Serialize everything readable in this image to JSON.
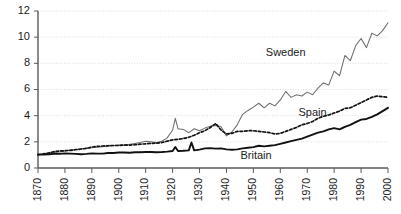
{
  "chart_data": {
    "type": "line",
    "title": "",
    "subtitle": "",
    "xlabel": "",
    "ylabel": "",
    "xlim": [
      1870,
      2000
    ],
    "ylim": [
      0,
      12
    ],
    "grid": true,
    "legend_position": "inline-annotations",
    "y_ticks": [
      0,
      2,
      4,
      6,
      8,
      10,
      12
    ],
    "y_tick_labels": [
      "0",
      "2",
      "4",
      "6",
      "8",
      "10",
      "12"
    ],
    "x_ticks": [
      1870,
      1880,
      1890,
      1900,
      1910,
      1920,
      1930,
      1940,
      1950,
      1960,
      1970,
      1980,
      1990,
      2000
    ],
    "x_tick_labels": [
      "1870",
      "1880",
      "1890",
      "1900",
      "1910",
      "1920",
      "1930",
      "1940",
      "1950",
      "1960",
      "1970",
      "1980",
      "1990",
      "2000"
    ],
    "annotations": [
      {
        "text": "Sweden",
        "x": 1962,
        "y": 8.55
      },
      {
        "text": "Spain",
        "x": 1972,
        "y": 4.0
      },
      {
        "text": "Britain",
        "x": 1951,
        "y": 0.65
      }
    ],
    "series": [
      {
        "name": "Sweden",
        "style": "thin-solid-gray",
        "color": "#6e6e6e",
        "x": [
          1870,
          1872,
          1874,
          1876,
          1878,
          1880,
          1882,
          1884,
          1886,
          1888,
          1890,
          1892,
          1894,
          1896,
          1898,
          1900,
          1902,
          1904,
          1906,
          1908,
          1910,
          1912,
          1914,
          1916,
          1918,
          1920,
          1921,
          1922,
          1924,
          1926,
          1928,
          1930,
          1932,
          1934,
          1936,
          1938,
          1940,
          1942,
          1944,
          1946,
          1948,
          1950,
          1952,
          1954,
          1956,
          1958,
          1960,
          1962,
          1964,
          1966,
          1968,
          1970,
          1972,
          1974,
          1976,
          1978,
          1980,
          1982,
          1984,
          1986,
          1988,
          1990,
          1992,
          1994,
          1996,
          1998,
          2000
        ],
        "values": [
          1.02,
          1.06,
          1.12,
          1.18,
          1.22,
          1.3,
          1.38,
          1.42,
          1.45,
          1.5,
          1.55,
          1.58,
          1.62,
          1.68,
          1.72,
          1.75,
          1.78,
          1.82,
          1.88,
          1.95,
          2.05,
          2.0,
          1.95,
          2.05,
          2.3,
          2.9,
          3.8,
          3.0,
          2.95,
          2.7,
          3.0,
          2.85,
          3.05,
          3.2,
          3.25,
          3.15,
          2.45,
          2.75,
          3.3,
          4.1,
          4.4,
          4.65,
          4.95,
          4.6,
          4.95,
          4.75,
          5.2,
          5.85,
          5.4,
          5.6,
          5.5,
          5.8,
          5.6,
          6.1,
          6.5,
          6.35,
          7.4,
          7.05,
          8.6,
          8.2,
          9.35,
          9.9,
          9.2,
          10.3,
          10.1,
          10.5,
          11.1
        ]
      },
      {
        "name": "Spain",
        "style": "dashed-black",
        "color": "#111111",
        "x": [
          1870,
          1872,
          1874,
          1876,
          1878,
          1880,
          1882,
          1884,
          1886,
          1888,
          1890,
          1892,
          1894,
          1896,
          1898,
          1900,
          1902,
          1904,
          1906,
          1908,
          1910,
          1912,
          1914,
          1916,
          1918,
          1920,
          1922,
          1924,
          1926,
          1928,
          1930,
          1932,
          1934,
          1936,
          1938,
          1940,
          1942,
          1944,
          1946,
          1948,
          1950,
          1952,
          1954,
          1956,
          1958,
          1960,
          1962,
          1964,
          1966,
          1968,
          1970,
          1972,
          1974,
          1976,
          1978,
          1980,
          1982,
          1984,
          1986,
          1988,
          1990,
          1992,
          1994,
          1996,
          1998,
          2000
        ],
        "values": [
          1.02,
          1.08,
          1.15,
          1.25,
          1.3,
          1.32,
          1.35,
          1.4,
          1.45,
          1.5,
          1.6,
          1.65,
          1.68,
          1.7,
          1.72,
          1.72,
          1.75,
          1.75,
          1.78,
          1.82,
          1.85,
          1.88,
          1.9,
          1.95,
          2.05,
          2.15,
          2.2,
          2.25,
          2.35,
          2.5,
          2.7,
          2.85,
          3.1,
          3.4,
          2.9,
          2.6,
          2.65,
          2.8,
          2.8,
          2.85,
          2.85,
          2.8,
          2.75,
          2.7,
          2.6,
          2.65,
          2.8,
          2.95,
          3.1,
          3.3,
          3.4,
          3.55,
          3.8,
          3.95,
          4.05,
          4.2,
          4.35,
          4.55,
          4.6,
          4.8,
          5.0,
          5.2,
          5.4,
          5.5,
          5.45,
          5.4
        ]
      },
      {
        "name": "Britain",
        "style": "thick-solid-black",
        "color": "#111111",
        "x": [
          1870,
          1872,
          1874,
          1876,
          1878,
          1880,
          1882,
          1884,
          1886,
          1888,
          1890,
          1892,
          1894,
          1896,
          1898,
          1900,
          1902,
          1904,
          1906,
          1908,
          1910,
          1912,
          1914,
          1916,
          1918,
          1920,
          1921,
          1922,
          1924,
          1926,
          1927,
          1928,
          1930,
          1932,
          1934,
          1936,
          1938,
          1940,
          1942,
          1944,
          1946,
          1948,
          1950,
          1952,
          1954,
          1956,
          1958,
          1960,
          1962,
          1964,
          1966,
          1968,
          1970,
          1972,
          1974,
          1976,
          1978,
          1980,
          1982,
          1984,
          1986,
          1988,
          1990,
          1992,
          1994,
          1996,
          1998,
          2000
        ],
        "values": [
          1.02,
          1.03,
          1.05,
          1.08,
          1.08,
          1.12,
          1.1,
          1.08,
          1.05,
          1.08,
          1.12,
          1.1,
          1.1,
          1.15,
          1.15,
          1.18,
          1.18,
          1.16,
          1.2,
          1.2,
          1.22,
          1.22,
          1.2,
          1.22,
          1.25,
          1.3,
          1.6,
          1.3,
          1.32,
          1.35,
          1.95,
          1.35,
          1.4,
          1.5,
          1.52,
          1.48,
          1.5,
          1.42,
          1.4,
          1.42,
          1.5,
          1.55,
          1.6,
          1.7,
          1.65,
          1.7,
          1.75,
          1.85,
          1.95,
          2.05,
          2.15,
          2.25,
          2.4,
          2.55,
          2.7,
          2.8,
          2.95,
          3.05,
          2.95,
          3.15,
          3.3,
          3.5,
          3.7,
          3.75,
          3.9,
          4.1,
          4.35,
          4.6
        ]
      }
    ]
  },
  "colors": {
    "background": "#ffffff",
    "gridline": "#cfcfd4",
    "axis": "#5a5a5a",
    "sweden": "#6e6e6e",
    "spain": "#111111",
    "britain": "#111111",
    "text": "#1a1a1a"
  }
}
